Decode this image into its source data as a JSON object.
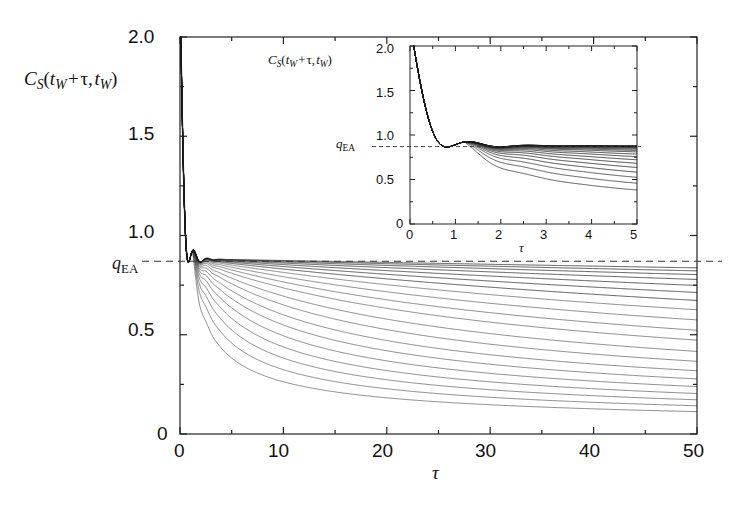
{
  "figure": {
    "kind": "scientific-plot",
    "background": "#ffffff",
    "line_color": "#1a1a1a",
    "dash_color": "#333333",
    "axis_color": "#222222"
  },
  "main_plot": {
    "ylabel": "C_S(t_W+τ, t_W)",
    "xlabel": "τ",
    "qea_label": "q_EA",
    "y_ticks": [
      "2.0",
      "1.5",
      "1.0",
      "0.5",
      "0"
    ],
    "y_tick_values": [
      2.0,
      1.5,
      1.0,
      0.5,
      0.0
    ],
    "x_ticks": [
      "0",
      "10",
      "20",
      "30",
      "40",
      "50"
    ],
    "x_tick_values": [
      0,
      10,
      20,
      30,
      40,
      50
    ],
    "xlim": [
      0,
      50
    ],
    "ylim": [
      0,
      2.0
    ],
    "qea_value": 0.87
  },
  "inset_plot": {
    "ylabel": "C_S(t_W+τ, t_W)",
    "xlabel": "τ",
    "qea_label": "q_EA",
    "y_ticks": [
      "2.0",
      "1.5",
      "1.0",
      "0.5",
      "0"
    ],
    "y_tick_values": [
      2.0,
      1.5,
      1.0,
      0.5,
      0.0
    ],
    "x_ticks": [
      "0",
      "1",
      "2",
      "3",
      "4",
      "5"
    ],
    "x_tick_values": [
      0,
      1,
      2,
      3,
      4,
      5
    ],
    "xlim": [
      0,
      5
    ],
    "ylim": [
      0,
      2.0
    ],
    "qea_value": 0.87
  },
  "chart_data": {
    "type": "line",
    "title": "",
    "xlabel": "τ",
    "ylabel": "C_S(t_W+τ, t_W)",
    "xlim": [
      0,
      50
    ],
    "ylim": [
      0,
      2.0
    ],
    "grid": false,
    "legend": "none",
    "annotations": [
      {
        "text": "q_EA",
        "y": 0.87,
        "style": "dashed-horizontal-line"
      }
    ],
    "qea": 0.87,
    "x": [
      0,
      0.15,
      0.3,
      0.45,
      0.6,
      0.75,
      0.9,
      1.05,
      1.2,
      1.4,
      1.7,
      2,
      2.5,
      3,
      4,
      5,
      6,
      8,
      10,
      13,
      16,
      20,
      25,
      30,
      35,
      40,
      45,
      50
    ],
    "series": [
      {
        "name": "t_W = 1",
        "values": [
          2.0,
          1.52,
          1.02,
          0.7,
          0.6,
          0.66,
          0.78,
          0.86,
          0.885,
          0.878,
          0.862,
          0.848,
          0.825,
          0.804,
          0.768,
          0.737,
          0.71,
          0.666,
          0.63,
          0.587,
          0.552,
          0.514,
          0.474,
          0.441,
          0.414,
          0.391,
          0.371,
          0.353
        ]
      },
      {
        "name": "t_W = 2",
        "values": [
          2.0,
          1.52,
          1.02,
          0.7,
          0.6,
          0.665,
          0.785,
          0.866,
          0.89,
          0.884,
          0.871,
          0.859,
          0.84,
          0.822,
          0.791,
          0.765,
          0.742,
          0.703,
          0.672,
          0.633,
          0.601,
          0.566,
          0.528,
          0.497,
          0.471,
          0.449,
          0.429,
          0.412
        ]
      },
      {
        "name": "t_W = 4",
        "values": [
          2.0,
          1.52,
          1.02,
          0.7,
          0.6,
          0.668,
          0.79,
          0.87,
          0.894,
          0.889,
          0.878,
          0.868,
          0.851,
          0.836,
          0.809,
          0.787,
          0.767,
          0.733,
          0.705,
          0.67,
          0.641,
          0.609,
          0.574,
          0.545,
          0.52,
          0.499,
          0.48,
          0.463
        ]
      },
      {
        "name": "t_W = 6",
        "values": [
          2.0,
          1.52,
          1.02,
          0.7,
          0.6,
          0.67,
          0.793,
          0.872,
          0.896,
          0.892,
          0.882,
          0.873,
          0.858,
          0.845,
          0.82,
          0.801,
          0.783,
          0.752,
          0.727,
          0.695,
          0.668,
          0.638,
          0.606,
          0.578,
          0.555,
          0.534,
          0.516,
          0.5
        ]
      },
      {
        "name": "t_W = 9",
        "values": [
          2.0,
          1.52,
          1.02,
          0.7,
          0.6,
          0.671,
          0.795,
          0.874,
          0.898,
          0.894,
          0.885,
          0.877,
          0.863,
          0.851,
          0.829,
          0.811,
          0.795,
          0.767,
          0.744,
          0.714,
          0.689,
          0.661,
          0.631,
          0.605,
          0.582,
          0.563,
          0.545,
          0.529
        ]
      },
      {
        "name": "t_W = 13",
        "values": [
          2.0,
          1.52,
          1.02,
          0.7,
          0.6,
          0.672,
          0.797,
          0.875,
          0.899,
          0.895,
          0.887,
          0.88,
          0.867,
          0.856,
          0.836,
          0.819,
          0.804,
          0.779,
          0.757,
          0.729,
          0.706,
          0.679,
          0.651,
          0.626,
          0.604,
          0.585,
          0.568,
          0.552
        ]
      },
      {
        "name": "t_W = 18",
        "values": [
          2.0,
          1.52,
          1.02,
          0.7,
          0.6,
          0.673,
          0.798,
          0.876,
          0.9,
          0.896,
          0.889,
          0.882,
          0.87,
          0.86,
          0.841,
          0.826,
          0.812,
          0.788,
          0.768,
          0.742,
          0.72,
          0.694,
          0.667,
          0.643,
          0.622,
          0.603,
          0.587,
          0.571
        ]
      },
      {
        "name": "t_W = 25",
        "values": [
          2.0,
          1.52,
          1.02,
          0.7,
          0.6,
          0.674,
          0.799,
          0.877,
          0.901,
          0.897,
          0.89,
          0.884,
          0.873,
          0.863,
          0.846,
          0.832,
          0.819,
          0.797,
          0.778,
          0.754,
          0.733,
          0.708,
          0.682,
          0.659,
          0.638,
          0.62,
          0.603,
          0.588
        ]
      },
      {
        "name": "t_W = 34",
        "values": [
          2.0,
          1.52,
          1.02,
          0.7,
          0.6,
          0.675,
          0.8,
          0.878,
          0.902,
          0.898,
          0.891,
          0.886,
          0.875,
          0.866,
          0.85,
          0.837,
          0.825,
          0.804,
          0.786,
          0.764,
          0.744,
          0.72,
          0.695,
          0.673,
          0.652,
          0.634,
          0.618,
          0.603
        ]
      },
      {
        "name": "t_W = 45",
        "values": [
          2.0,
          1.52,
          1.02,
          0.7,
          0.6,
          0.676,
          0.801,
          0.879,
          0.903,
          0.899,
          0.892,
          0.887,
          0.877,
          0.869,
          0.853,
          0.841,
          0.83,
          0.81,
          0.793,
          0.772,
          0.753,
          0.73,
          0.706,
          0.684,
          0.664,
          0.646,
          0.631,
          0.616
        ]
      },
      {
        "name": "t_W = 60",
        "values": [
          2.0,
          1.52,
          1.02,
          0.7,
          0.6,
          0.677,
          0.802,
          0.88,
          0.903,
          0.9,
          0.893,
          0.888,
          0.879,
          0.871,
          0.856,
          0.845,
          0.834,
          0.815,
          0.799,
          0.779,
          0.761,
          0.739,
          0.715,
          0.694,
          0.675,
          0.657,
          0.642,
          0.628
        ]
      },
      {
        "name": "t_W = 80",
        "values": [
          2.0,
          1.52,
          1.02,
          0.7,
          0.6,
          0.678,
          0.803,
          0.88,
          0.904,
          0.9,
          0.894,
          0.889,
          0.88,
          0.873,
          0.859,
          0.848,
          0.838,
          0.82,
          0.804,
          0.785,
          0.768,
          0.746,
          0.723,
          0.703,
          0.684,
          0.667,
          0.652,
          0.638
        ]
      },
      {
        "name": "t_W = 110",
        "values": [
          2.0,
          1.52,
          1.02,
          0.7,
          0.6,
          0.679,
          0.804,
          0.881,
          0.904,
          0.901,
          0.895,
          0.89,
          0.881,
          0.875,
          0.861,
          0.851,
          0.841,
          0.824,
          0.809,
          0.79,
          0.774,
          0.753,
          0.731,
          0.711,
          0.692,
          0.676,
          0.661,
          0.648
        ]
      },
      {
        "name": "t_W = 150",
        "values": [
          2.0,
          1.52,
          1.02,
          0.7,
          0.6,
          0.679,
          0.804,
          0.881,
          0.905,
          0.901,
          0.896,
          0.891,
          0.883,
          0.876,
          0.863,
          0.853,
          0.844,
          0.828,
          0.813,
          0.795,
          0.779,
          0.759,
          0.738,
          0.718,
          0.7,
          0.684,
          0.67,
          0.656
        ]
      },
      {
        "name": "t_W = 200",
        "values": [
          2.0,
          1.52,
          1.02,
          0.7,
          0.6,
          0.68,
          0.805,
          0.882,
          0.905,
          0.902,
          0.896,
          0.892,
          0.884,
          0.877,
          0.865,
          0.855,
          0.846,
          0.831,
          0.817,
          0.799,
          0.784,
          0.764,
          0.743,
          0.724,
          0.706,
          0.691,
          0.677,
          0.664
        ]
      },
      {
        "name": "t_W = 280",
        "values": [
          2.0,
          1.52,
          1.02,
          0.7,
          0.6,
          0.68,
          0.805,
          0.882,
          0.906,
          0.902,
          0.897,
          0.892,
          0.885,
          0.878,
          0.866,
          0.857,
          0.848,
          0.833,
          0.82,
          0.803,
          0.788,
          0.769,
          0.748,
          0.73,
          0.713,
          0.697,
          0.684,
          0.671
        ]
      },
      {
        "name": "t_W = 400",
        "values": [
          2.0,
          1.52,
          1.02,
          0.7,
          0.6,
          0.681,
          0.806,
          0.883,
          0.906,
          0.903,
          0.897,
          0.893,
          0.886,
          0.879,
          0.867,
          0.858,
          0.85,
          0.836,
          0.823,
          0.806,
          0.792,
          0.773,
          0.753,
          0.735,
          0.718,
          0.703,
          0.69,
          0.677
        ]
      },
      {
        "name": "t_W = 600",
        "values": [
          2.0,
          1.52,
          1.02,
          0.7,
          0.6,
          0.681,
          0.806,
          0.883,
          0.907,
          0.903,
          0.898,
          0.894,
          0.887,
          0.88,
          0.869,
          0.86,
          0.852,
          0.838,
          0.826,
          0.809,
          0.795,
          0.777,
          0.757,
          0.739,
          0.723,
          0.709,
          0.695,
          0.683
        ]
      }
    ],
    "inset": {
      "type": "line",
      "xlabel": "τ",
      "ylabel": "C_S(t_W+τ, t_W)",
      "xlim": [
        0,
        5
      ],
      "ylim": [
        0,
        2.0
      ],
      "qea": 0.87,
      "note": "Magnification of the short-time region: common sharp minimum ~0.60 at tau~0.6, small overshoot near tau~1.2, then the slowest curves hold the q_EA plateau while the two shortest t_W curves fall to ~0.80 and ~0.68 at tau=5."
    }
  }
}
